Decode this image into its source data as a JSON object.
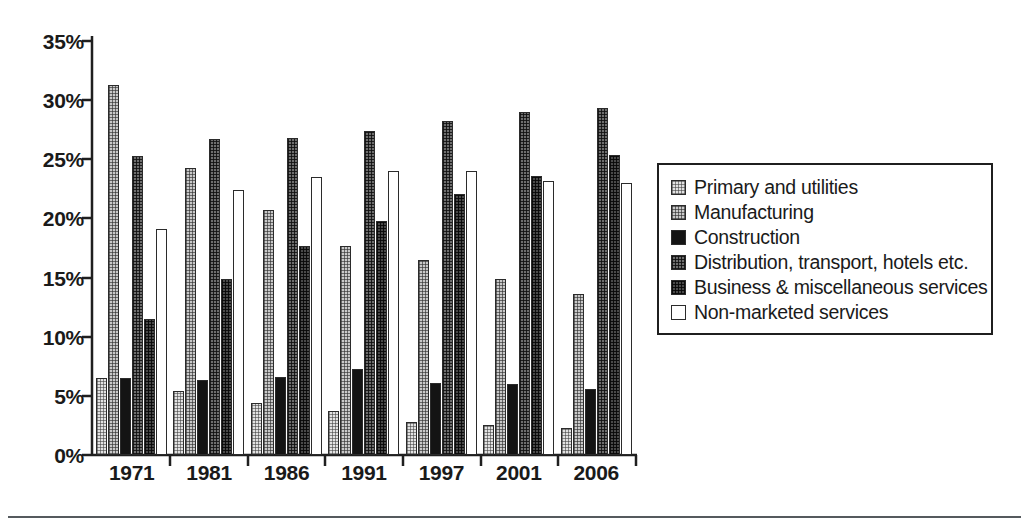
{
  "chart_data": {
    "type": "bar",
    "title": "",
    "subtitle": "",
    "xlabel": "",
    "ylabel": "",
    "categories": [
      "1971",
      "1981",
      "1986",
      "1991",
      "1997",
      "2001",
      "2006"
    ],
    "series": [
      {
        "name": "Primary and utilities",
        "values": [
          6.5,
          5.4,
          4.4,
          3.7,
          2.8,
          2.5,
          2.3
        ]
      },
      {
        "name": "Manufacturing",
        "values": [
          31.3,
          24.3,
          20.7,
          17.7,
          16.5,
          14.9,
          13.6
        ]
      },
      {
        "name": "Construction",
        "values": [
          6.5,
          6.3,
          6.6,
          7.3,
          6.1,
          6.0,
          5.6
        ]
      },
      {
        "name": "Distribution, transport, hotels etc.",
        "values": [
          25.3,
          26.7,
          26.8,
          27.4,
          28.2,
          29.0,
          29.3
        ]
      },
      {
        "name": "Business & miscellaneous services",
        "values": [
          11.5,
          14.9,
          17.7,
          19.8,
          22.1,
          23.6,
          25.4
        ]
      },
      {
        "name": "Non-marketed services",
        "values": [
          19.1,
          22.4,
          23.5,
          24.0,
          24.0,
          23.2,
          23.0
        ]
      }
    ],
    "ylim": [
      0,
      35
    ],
    "yticks": [
      0,
      5,
      10,
      15,
      20,
      25,
      30,
      35
    ],
    "ytick_labels": [
      "0%",
      "5%",
      "10%",
      "15%",
      "20%",
      "25%",
      "30%",
      "35%"
    ],
    "grid": false,
    "legend_position": "right",
    "annotations": []
  },
  "axes": {
    "y_tick_labels": [
      "35%",
      "30%",
      "25%",
      "20%",
      "15%",
      "10%",
      "5%",
      "0%"
    ],
    "x_tick_labels": [
      "1971",
      "1981",
      "1986",
      "1991",
      "1997",
      "2001",
      "2006"
    ]
  },
  "legend": {
    "items": [
      {
        "label": "Primary and utilities",
        "swatch": "very-light-halftone",
        "color": "#e2e2e2"
      },
      {
        "label": "Manufacturing",
        "swatch": "light-halftone",
        "color": "#c9c9c9"
      },
      {
        "label": "Construction",
        "swatch": "solid-black",
        "color": "#141414"
      },
      {
        "label": "Distribution, transport, hotels etc.",
        "swatch": "medium-halftone",
        "color": "#6e6e6e"
      },
      {
        "label": "Business & miscellaneous services",
        "swatch": "dark-halftone",
        "color": "#4a4a4a"
      },
      {
        "label": "Non-marketed services",
        "swatch": "white-outline",
        "color": "#ffffff"
      }
    ]
  },
  "style": {
    "axis_color": "#1f1f1f",
    "text_color": "#1a1a1a",
    "rule_color": "#555a5e",
    "background": "#ffffff"
  }
}
